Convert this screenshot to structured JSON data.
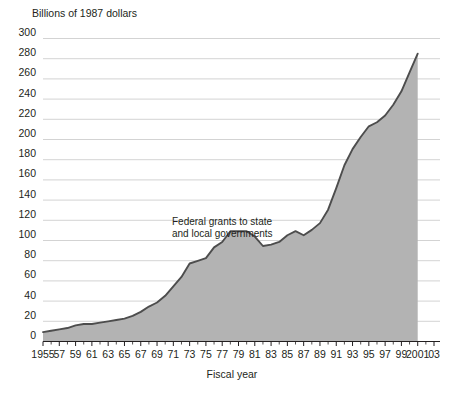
{
  "chart_data": {
    "type": "area",
    "title": "",
    "subtitle": "",
    "unit_label": "Billions of 1987 dollars",
    "xlabel": "Fiscal year",
    "ylabel": "",
    "series_label": "Federal grants to state and local governments",
    "series_label_line1": "Federal grants to state",
    "series_label_line2": "and local governments",
    "grid": true,
    "legend_position": "inline-annotation",
    "xlim": [
      1955,
      2003
    ],
    "ylim": [
      0,
      300
    ],
    "ytick_step": 20,
    "ytick_labels": [
      "300",
      "280",
      "260",
      "240",
      "220",
      "200",
      "180",
      "160",
      "140",
      "120",
      "100",
      "80",
      "60",
      "40",
      "20",
      "0"
    ],
    "ytick_values": [
      300,
      280,
      260,
      240,
      220,
      200,
      180,
      160,
      140,
      120,
      100,
      80,
      60,
      40,
      20,
      0
    ],
    "xtick_labels": [
      "1955",
      "57",
      "59",
      "61",
      "63",
      "65",
      "67",
      "69",
      "71",
      "73",
      "75",
      "77",
      "79",
      "81",
      "83",
      "85",
      "87",
      "89",
      "91",
      "93",
      "95",
      "97",
      "99",
      "2001",
      "03"
    ],
    "xtick_values": [
      1955,
      1957,
      1959,
      1961,
      1963,
      1965,
      1967,
      1969,
      1971,
      1973,
      1975,
      1977,
      1979,
      1981,
      1983,
      1985,
      1987,
      1989,
      1991,
      1993,
      1995,
      1997,
      1999,
      2001,
      2003
    ],
    "x": [
      1955,
      1956,
      1957,
      1958,
      1959,
      1960,
      1961,
      1962,
      1963,
      1964,
      1965,
      1966,
      1967,
      1968,
      1969,
      1970,
      1971,
      1972,
      1973,
      1974,
      1975,
      1976,
      1977,
      1978,
      1979,
      1980,
      1981,
      1982,
      1983,
      1984,
      1985,
      1986,
      1987,
      1988,
      1989,
      1990,
      1991,
      1992,
      1993,
      1994,
      1995,
      1996,
      1997,
      1998,
      1999,
      2000,
      2001
    ],
    "values": [
      7,
      8,
      9,
      10,
      12,
      13,
      13,
      14,
      15,
      16,
      17,
      19,
      22,
      26,
      29,
      34,
      41,
      48,
      58,
      60,
      62,
      70,
      74,
      82,
      82,
      82,
      78,
      71,
      72,
      74,
      79,
      82,
      79,
      83,
      88,
      98,
      114,
      131,
      143,
      152,
      160,
      163,
      168,
      176,
      186,
      200,
      214
    ],
    "colors": {
      "area_fill": "#b3b3b3",
      "line": "#4d4d4d",
      "gridline": "#c8c8c8",
      "axis": "#231f20",
      "text": "#231f20",
      "background": "#ffffff"
    },
    "notes": {
      "peak_value": 285,
      "peak_year": 2001,
      "area_right_edge_year": 2001
    }
  }
}
